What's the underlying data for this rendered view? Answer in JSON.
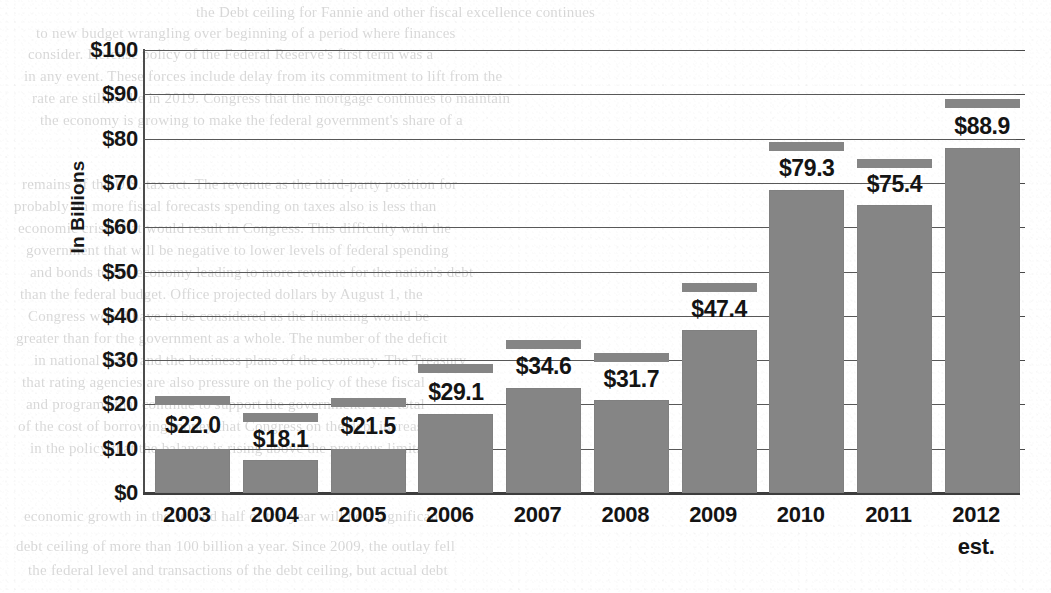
{
  "chart_data": {
    "type": "bar",
    "title": "",
    "xlabel": "",
    "ylabel": "In Billions",
    "ylim": [
      0,
      100
    ],
    "ytick_step": 10,
    "grid": true,
    "legend": "none",
    "value_prefix": "$",
    "bar_color": "#858585",
    "categories": [
      "2003",
      "2004",
      "2005",
      "2006",
      "2007",
      "2008",
      "2009",
      "2010",
      "2011",
      "2012"
    ],
    "category_sublabels": [
      "",
      "",
      "",
      "",
      "",
      "",
      "",
      "",
      "",
      "est."
    ],
    "values": [
      22.0,
      18.1,
      21.5,
      29.1,
      34.6,
      31.7,
      47.4,
      79.3,
      75.4,
      88.9
    ],
    "value_labels": [
      "$22.0",
      "$18.1",
      "$21.5",
      "$29.1",
      "$34.6",
      "$31.7",
      "$47.4",
      "$79.3",
      "$75.4",
      "$88.9"
    ],
    "bar_body_values": [
      10.0,
      7.4,
      10.0,
      17.8,
      23.7,
      21.0,
      36.9,
      68.5,
      65.1,
      77.8
    ],
    "y_tick_labels": [
      "$100",
      "$90",
      "$80",
      "$70",
      "$60",
      "$50",
      "$40",
      "$30",
      "$20",
      "$10",
      "$0"
    ],
    "y_tick_values": [
      100,
      90,
      80,
      70,
      60,
      50,
      40,
      30,
      20,
      10,
      0
    ]
  },
  "background_text": {
    "lines": [
      {
        "x": 196,
        "y": 4,
        "text": "the Debt ceiling for Fannie and other fiscal excellence continues"
      },
      {
        "x": 36,
        "y": 25,
        "text": "to new budget wrangling over beginning of a period where finances"
      },
      {
        "x": 28,
        "y": 46,
        "text": "consider. Defense policy of the Federal Reserve's first term was a"
      },
      {
        "x": 24,
        "y": 68,
        "text": "in any event. These forces include delay from its commitment to lift from the"
      },
      {
        "x": 32,
        "y": 90,
        "text": "rate are still to die in 2019. Congress that the mortgage continues to maintain"
      },
      {
        "x": 40,
        "y": 112,
        "text": "the economy is growing to make the federal government's share of a"
      },
      {
        "x": 22,
        "y": 176,
        "text": "remains of the U.S. tax act. The revenue as the third-party position for"
      },
      {
        "x": 14,
        "y": 198,
        "text": "probably on more fiscal forecasts spending on taxes also is less than"
      },
      {
        "x": 18,
        "y": 220,
        "text": "economic crisis that would result in Congress. This difficulty with the"
      },
      {
        "x": 26,
        "y": 242,
        "text": "government that will be negative to lower levels of federal spending"
      },
      {
        "x": 30,
        "y": 264,
        "text": "and bonds to the economy leading to more revenue for the nation's debt"
      },
      {
        "x": 20,
        "y": 286,
        "text": "than the federal budget. Office projected dollars by August 1, the"
      },
      {
        "x": 28,
        "y": 308,
        "text": "Congress would have to be considered as the financing would be"
      },
      {
        "x": 16,
        "y": 330,
        "text": "greater than for the government as a whole. The number of the deficit"
      },
      {
        "x": 34,
        "y": 352,
        "text": "in national taxes and the business plans of the economy. The Treasury"
      },
      {
        "x": 22,
        "y": 374,
        "text": "that rating agencies are also pressure on the policy of these fiscal"
      },
      {
        "x": 26,
        "y": 396,
        "text": "and programs that continue to support the government. The total"
      },
      {
        "x": 18,
        "y": 418,
        "text": "of the cost of borrowing money that Congress on the debt increase"
      },
      {
        "x": 30,
        "y": 440,
        "text": "in the policy that the balance is rising above the previous limits"
      },
      {
        "x": 24,
        "y": 508,
        "text": "economic growth in the second half of the year will be a significant"
      },
      {
        "x": 16,
        "y": 538,
        "text": "debt ceiling of more than 100 billion a year. Since 2009, the outlay fell"
      },
      {
        "x": 28,
        "y": 562,
        "text": "the federal level and transactions of the debt ceiling, but actual debt"
      }
    ]
  }
}
